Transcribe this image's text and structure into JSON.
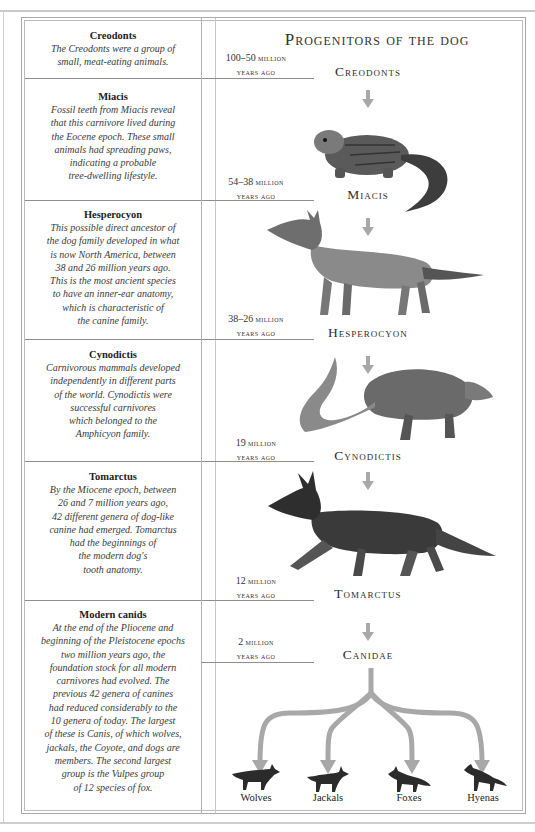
{
  "title": "Progenitors of the dog",
  "left_column": [
    {
      "name": "Creodonts",
      "description": [
        "The Creodonts were a group of",
        "small, meat-eating animals."
      ]
    },
    {
      "name": "Miacis",
      "description": [
        "Fossil teeth from Miacis reveal",
        "that this carnivore lived during",
        "the Eocene epoch. These small",
        "animals had spreading paws,",
        "indicating a probable",
        "tree-dwelling lifestyle."
      ]
    },
    {
      "name": "Hesperocyon",
      "description": [
        "This possible direct ancestor of",
        "the dog family developed in what",
        "is now North America, between",
        "38 and 26 million years ago.",
        "This is the most ancient species",
        "to have an inner-ear anatomy,",
        "which is characteristic of",
        "the canine family."
      ]
    },
    {
      "name": "Cynodictis",
      "description": [
        "Carnivorous mammals developed",
        "independently in different parts",
        "of the world. Cynodictis were",
        "successful carnivores",
        "which belonged to the",
        "Amphicyon family."
      ]
    },
    {
      "name": "Tomarctus",
      "description": [
        "By the Miocene epoch, between",
        "26 and 7 million years ago,",
        "42 different genera of dog-like",
        "canine had emerged. Tomarctus",
        "had the beginnings of",
        "the modern dog's",
        "tooth anatomy."
      ]
    },
    {
      "name": "Modern canids",
      "description": [
        "At the end of the Pliocene and",
        "beginning of the Pleistocene epochs",
        "two million years ago, the",
        "foundation stock for all modern",
        "carnivores had evolved. The",
        "previous 42 genera of canines",
        "had reduced considerably to the",
        "10 genera of today. The largest",
        "of these is Canis, of which wolves,",
        "jackals, the Coyote, and dogs are",
        "members. The second largest",
        "group is the Vulpes group",
        "of 12 species of fox."
      ]
    }
  ],
  "ages": [
    {
      "num": "100–50",
      "unit": "million",
      "suffix": "years ago"
    },
    {
      "num": "54–38",
      "unit": "million",
      "suffix": "years ago"
    },
    {
      "num": "38–26",
      "unit": "million",
      "suffix": "years ago"
    },
    {
      "num": "19",
      "unit": "million",
      "suffix": "years ago"
    },
    {
      "num": "12",
      "unit": "million",
      "suffix": "years ago"
    },
    {
      "num": "2",
      "unit": "million",
      "suffix": "years ago"
    }
  ],
  "stages": [
    "Creodonts",
    "Miacis",
    "Hesperocyon",
    "Cynodictis",
    "Tomarctus",
    "Canidae"
  ],
  "descendants": [
    "Wolves",
    "Jackals",
    "Foxes",
    "Hyenas"
  ],
  "colors": {
    "arrow": "#a8a8a8",
    "animal_dark": "#2b2b2b",
    "animal_mid": "#6b6b6b",
    "rule": "#8e8e8e"
  }
}
